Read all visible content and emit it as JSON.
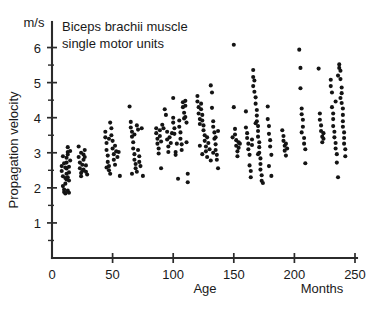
{
  "chart_data": {
    "type": "scatter",
    "title": "Biceps brachii muscle single motor units",
    "title_lines": [
      "Biceps brachii muscle",
      "single motor units"
    ],
    "xlabel": "Age",
    "xunit": "Months",
    "ylabel": "Propagation velocity",
    "yunit": "m/s",
    "xlim": [
      0,
      250
    ],
    "ylim": [
      0,
      6.5
    ],
    "xticks": [
      0,
      50,
      100,
      150,
      200,
      250
    ],
    "xtick_labels": [
      "0",
      "50",
      "100",
      "150",
      "200",
      "250"
    ],
    "yticks": [
      1,
      2,
      3,
      4,
      5,
      6
    ],
    "ytick_labels": [
      "1",
      "2",
      "3",
      "4",
      "5",
      "6"
    ],
    "yminor_ticks": [
      0.5,
      1.5,
      2.5,
      3.5,
      4.5,
      5.5
    ],
    "grid": false,
    "legend": false,
    "marker": "filled-circle",
    "marker_color": "#141414",
    "points": [
      [
        8,
        2.62
      ],
      [
        8,
        2.48
      ],
      [
        9,
        2.33
      ],
      [
        9,
        2.05
      ],
      [
        10,
        1.95
      ],
      [
        10,
        1.88
      ],
      [
        11,
        1.84
      ],
      [
        11,
        2.12
      ],
      [
        11,
        2.28
      ],
      [
        12,
        2.4
      ],
      [
        12,
        2.55
      ],
      [
        12,
        2.72
      ],
      [
        12,
        2.86
      ],
      [
        13,
        3.02
      ],
      [
        13,
        3.16
      ],
      [
        13,
        2.95
      ],
      [
        13,
        2.3
      ],
      [
        14,
        2.21
      ],
      [
        14,
        2.44
      ],
      [
        14,
        2.6
      ],
      [
        15,
        2.78
      ],
      [
        15,
        3.05
      ],
      [
        10,
        2.7
      ],
      [
        9,
        2.9
      ],
      [
        11,
        2.58
      ],
      [
        12,
        2.24
      ],
      [
        13,
        1.92
      ],
      [
        14,
        1.86
      ],
      [
        22,
        3.18
      ],
      [
        22,
        2.88
      ],
      [
        23,
        2.72
      ],
      [
        23,
        2.56
      ],
      [
        24,
        2.42
      ],
      [
        24,
        2.33
      ],
      [
        25,
        2.48
      ],
      [
        25,
        2.66
      ],
      [
        26,
        2.8
      ],
      [
        26,
        2.95
      ],
      [
        27,
        3.08
      ],
      [
        27,
        2.88
      ],
      [
        28,
        2.64
      ],
      [
        28,
        2.46
      ],
      [
        29,
        2.38
      ],
      [
        24,
        3.0
      ],
      [
        26,
        2.52
      ],
      [
        44,
        3.6
      ],
      [
        44,
        3.44
      ],
      [
        45,
        3.28
      ],
      [
        45,
        3.08
      ],
      [
        46,
        2.92
      ],
      [
        46,
        2.74
      ],
      [
        47,
        2.62
      ],
      [
        47,
        2.5
      ],
      [
        48,
        2.4
      ],
      [
        48,
        3.86
      ],
      [
        49,
        3.7
      ],
      [
        49,
        3.5
      ],
      [
        50,
        3.34
      ],
      [
        50,
        3.12
      ],
      [
        51,
        2.96
      ],
      [
        51,
        2.8
      ],
      [
        52,
        2.66
      ],
      [
        52,
        3.2
      ],
      [
        53,
        3.04
      ],
      [
        54,
        2.88
      ],
      [
        55,
        3.02
      ],
      [
        56,
        2.34
      ],
      [
        45,
        2.58
      ],
      [
        47,
        3.4
      ],
      [
        64,
        4.32
      ],
      [
        65,
        3.88
      ],
      [
        65,
        3.72
      ],
      [
        66,
        3.6
      ],
      [
        66,
        3.46
      ],
      [
        67,
        3.3
      ],
      [
        67,
        3.12
      ],
      [
        68,
        2.96
      ],
      [
        68,
        2.8
      ],
      [
        69,
        2.68
      ],
      [
        69,
        2.56
      ],
      [
        70,
        2.46
      ],
      [
        70,
        3.78
      ],
      [
        71,
        3.66
      ],
      [
        71,
        3.08
      ],
      [
        72,
        2.9
      ],
      [
        72,
        2.74
      ],
      [
        73,
        2.62
      ],
      [
        74,
        3.7
      ],
      [
        75,
        2.34
      ],
      [
        66,
        2.4
      ],
      [
        68,
        3.52
      ],
      [
        86,
        3.7
      ],
      [
        86,
        3.56
      ],
      [
        87,
        3.4
      ],
      [
        87,
        3.26
      ],
      [
        88,
        3.12
      ],
      [
        88,
        2.98
      ],
      [
        89,
        3.64
      ],
      [
        89,
        3.48
      ],
      [
        90,
        3.32
      ],
      [
        90,
        2.56
      ],
      [
        91,
        3.8
      ],
      [
        92,
        3.7
      ],
      [
        93,
        4.24
      ],
      [
        94,
        4.08
      ],
      [
        95,
        3.6
      ],
      [
        95,
        3.38
      ],
      [
        96,
        3.18
      ],
      [
        96,
        3.02
      ],
      [
        97,
        3.44
      ],
      [
        98,
        3.28
      ],
      [
        99,
        3.56
      ],
      [
        100,
        4.56
      ],
      [
        100,
        4.0
      ],
      [
        100,
        3.86
      ],
      [
        101,
        3.7
      ],
      [
        101,
        3.54
      ],
      [
        102,
        3.02
      ],
      [
        102,
        2.94
      ],
      [
        103,
        3.26
      ],
      [
        104,
        2.26
      ],
      [
        105,
        3.92
      ],
      [
        105,
        3.74
      ],
      [
        106,
        3.58
      ],
      [
        106,
        3.4
      ],
      [
        107,
        3.24
      ],
      [
        107,
        3.08
      ],
      [
        108,
        4.44
      ],
      [
        108,
        4.3
      ],
      [
        109,
        4.14
      ],
      [
        109,
        3.98
      ],
      [
        110,
        4.48
      ],
      [
        110,
        4.34
      ],
      [
        110,
        4.02
      ],
      [
        111,
        3.86
      ],
      [
        111,
        3.3
      ],
      [
        112,
        2.4
      ],
      [
        112,
        2.16
      ],
      [
        120,
        4.62
      ],
      [
        120,
        4.46
      ],
      [
        121,
        4.3
      ],
      [
        121,
        4.12
      ],
      [
        122,
        3.96
      ],
      [
        122,
        3.82
      ],
      [
        123,
        4.4
      ],
      [
        123,
        4.24
      ],
      [
        124,
        4.08
      ],
      [
        124,
        3.92
      ],
      [
        125,
        3.78
      ],
      [
        125,
        3.64
      ],
      [
        126,
        3.5
      ],
      [
        126,
        3.34
      ],
      [
        127,
        3.18
      ],
      [
        127,
        3.04
      ],
      [
        128,
        2.88
      ],
      [
        128,
        3.44
      ],
      [
        129,
        3.28
      ],
      [
        130,
        3.1
      ],
      [
        131,
        2.78
      ],
      [
        122,
        3.2
      ],
      [
        124,
        2.96
      ],
      [
        131,
        4.92
      ],
      [
        132,
        4.72
      ],
      [
        132,
        4.28
      ],
      [
        133,
        3.9
      ],
      [
        133,
        3.74
      ],
      [
        134,
        3.58
      ],
      [
        134,
        3.4
      ],
      [
        135,
        3.24
      ],
      [
        135,
        3.08
      ],
      [
        136,
        2.94
      ],
      [
        136,
        2.8
      ],
      [
        137,
        3.62
      ],
      [
        137,
        2.56
      ],
      [
        133,
        3.0
      ],
      [
        135,
        3.44
      ],
      [
        150,
        6.08
      ],
      [
        150,
        4.3
      ],
      [
        151,
        3.68
      ],
      [
        151,
        3.52
      ],
      [
        152,
        3.36
      ],
      [
        152,
        3.2
      ],
      [
        153,
        3.04
      ],
      [
        153,
        2.9
      ],
      [
        154,
        3.3
      ],
      [
        154,
        3.14
      ],
      [
        155,
        3.26
      ],
      [
        149,
        3.44
      ],
      [
        160,
        4.18
      ],
      [
        160,
        3.72
      ],
      [
        161,
        3.56
      ],
      [
        161,
        3.42
      ],
      [
        162,
        3.26
      ],
      [
        162,
        3.1
      ],
      [
        163,
        2.94
      ],
      [
        163,
        2.64
      ],
      [
        164,
        2.48
      ],
      [
        164,
        2.3
      ],
      [
        165,
        3.38
      ],
      [
        165,
        3.22
      ],
      [
        166,
        5.36
      ],
      [
        166,
        5.16
      ],
      [
        167,
        5.06
      ],
      [
        167,
        4.74
      ],
      [
        168,
        4.58
      ],
      [
        168,
        4.4
      ],
      [
        169,
        4.22
      ],
      [
        169,
        4.06
      ],
      [
        169,
        3.9
      ],
      [
        170,
        3.76
      ],
      [
        170,
        3.62
      ],
      [
        170,
        3.46
      ],
      [
        171,
        3.3
      ],
      [
        171,
        3.16
      ],
      [
        171,
        3.0
      ],
      [
        172,
        2.84
      ],
      [
        172,
        2.68
      ],
      [
        172,
        2.52
      ],
      [
        173,
        2.36
      ],
      [
        173,
        2.2
      ],
      [
        174,
        2.14
      ],
      [
        168,
        3.84
      ],
      [
        166,
        4.9
      ],
      [
        170,
        2.96
      ],
      [
        178,
        4.32
      ],
      [
        178,
        3.96
      ],
      [
        179,
        3.76
      ],
      [
        179,
        3.54
      ],
      [
        180,
        3.36
      ],
      [
        180,
        3.18
      ],
      [
        181,
        2.94
      ],
      [
        181,
        2.34
      ],
      [
        179,
        2.62
      ],
      [
        190,
        3.64
      ],
      [
        191,
        3.48
      ],
      [
        191,
        3.34
      ],
      [
        192,
        3.2
      ],
      [
        192,
        3.06
      ],
      [
        193,
        2.92
      ],
      [
        193,
        3.26
      ],
      [
        194,
        3.12
      ],
      [
        204,
        5.94
      ],
      [
        205,
        5.42
      ],
      [
        205,
        4.84
      ],
      [
        206,
        4.26
      ],
      [
        206,
        4.1
      ],
      [
        207,
        3.94
      ],
      [
        207,
        3.74
      ],
      [
        208,
        3.42
      ],
      [
        208,
        3.26
      ],
      [
        209,
        3.1
      ],
      [
        209,
        2.7
      ],
      [
        206,
        3.58
      ],
      [
        220,
        5.4
      ],
      [
        221,
        4.12
      ],
      [
        221,
        3.94
      ],
      [
        222,
        3.78
      ],
      [
        222,
        3.62
      ],
      [
        223,
        3.46
      ],
      [
        223,
        3.3
      ],
      [
        224,
        3.56
      ],
      [
        224,
        3.4
      ],
      [
        230,
        5.08
      ],
      [
        230,
        4.9
      ],
      [
        231,
        4.72
      ],
      [
        231,
        4.3
      ],
      [
        232,
        4.12
      ],
      [
        232,
        3.96
      ],
      [
        233,
        3.6
      ],
      [
        233,
        3.44
      ],
      [
        234,
        3.28
      ],
      [
        234,
        3.12
      ],
      [
        235,
        2.96
      ],
      [
        235,
        2.72
      ],
      [
        236,
        2.3
      ],
      [
        232,
        3.76
      ],
      [
        234,
        4.46
      ],
      [
        237,
        5.52
      ],
      [
        237,
        5.42
      ],
      [
        238,
        5.34
      ],
      [
        238,
        5.1
      ],
      [
        239,
        4.86
      ],
      [
        239,
        4.7
      ],
      [
        239,
        4.42
      ],
      [
        240,
        4.26
      ],
      [
        240,
        4.08
      ],
      [
        240,
        3.9
      ],
      [
        240,
        3.74
      ],
      [
        241,
        3.58
      ],
      [
        241,
        3.42
      ],
      [
        241,
        3.26
      ],
      [
        242,
        3.1
      ],
      [
        242,
        2.9
      ],
      [
        238,
        4.56
      ],
      [
        236,
        5.2
      ]
    ]
  }
}
